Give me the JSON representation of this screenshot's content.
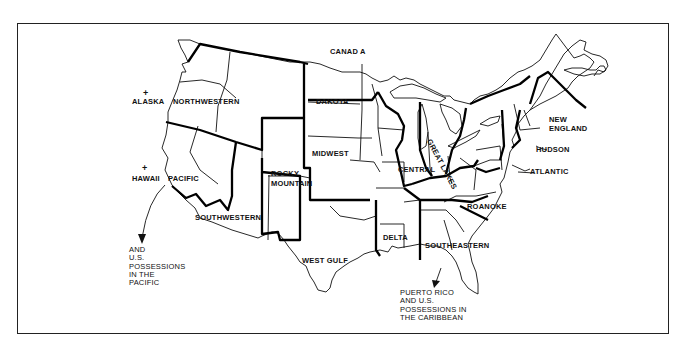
{
  "map": {
    "type": "regional boundary map of the United States",
    "labels": {
      "canada": "CANAD A",
      "alaska": "ALASKA",
      "hawaii": "HAWAII",
      "northwestern": "NORTHWESTERN",
      "dakota": "DAKOTA",
      "midwest": "MIDWEST",
      "pacific": "PACIFIC",
      "rocky_mountain_1": "ROCKY",
      "rocky_mountain_2": "MOUNTAIN",
      "southwestern": "SOUTHWESTERN",
      "west_gulf": "WEST  GULF",
      "central": "CENTRAL",
      "great_lakes": "GREAT LAKES",
      "delta": "DELTA",
      "southeastern": "SOUTHEASTERN",
      "roanoke": "ROANOKE",
      "new_england_1": "NEW",
      "new_england_2": "ENGLAND",
      "hudson": "HUDSON",
      "atlantic": "ATLANTIC",
      "pacific_possessions": "AND\nU.S.\nPOSSESSIONS\nIN THE\nPACIFIC",
      "caribbean_possessions": "PUERTO RICO\nAND U.S.\nPOSSESSIONS IN\nTHE CARIBBEAN"
    },
    "markers": {
      "alaska_marker": "+",
      "hawaii_marker": "+"
    },
    "regions": [
      "Northwestern",
      "Pacific",
      "Southwestern",
      "Rocky Mountain",
      "Dakota",
      "Midwest",
      "West Gulf",
      "Central",
      "Great Lakes",
      "Delta",
      "Southeastern",
      "Roanoke",
      "Atlantic",
      "Hudson",
      "New England"
    ],
    "colors": {
      "ink": "#111111",
      "paper": "#ffffff"
    }
  }
}
